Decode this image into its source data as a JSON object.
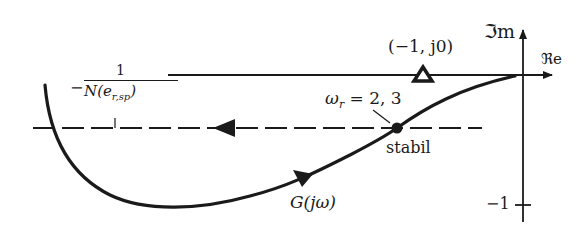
{
  "diagram": {
    "type": "nyquist_describing_function",
    "axes": {
      "imag_label": "ℑm",
      "real_label": "ℜe",
      "tick_label": "−1"
    },
    "critical_point": {
      "label": "(−1, j0)"
    },
    "describing_function": {
      "label_minus": "−",
      "label_numerator": "1",
      "label_denominator": "N(e",
      "label_denominator_sub": "r,sp",
      "label_denominator_close": ")"
    },
    "intersection": {
      "omega_label": "ω",
      "omega_sub": "r",
      "omega_value": " = 2, 3",
      "stability_label": "stabil"
    },
    "frequency_response": {
      "label": "G(jω)"
    },
    "colors": {
      "ink": "#1a1a1a",
      "background": "#ffffff"
    }
  }
}
